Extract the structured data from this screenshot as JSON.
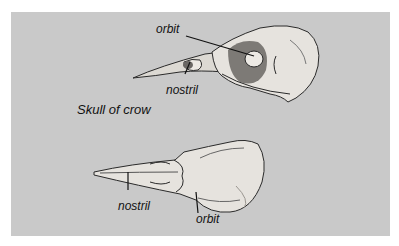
{
  "figure": {
    "caption": "Skull of crow",
    "side_view": {
      "labels": {
        "orbit": "orbit",
        "nostril": "nostril"
      }
    },
    "top_view": {
      "labels": {
        "nostril": "nostril",
        "orbit": "orbit"
      }
    },
    "colors": {
      "panel": "#c9c9c9",
      "bone": "#e4e1dc",
      "line": "#222222"
    }
  }
}
